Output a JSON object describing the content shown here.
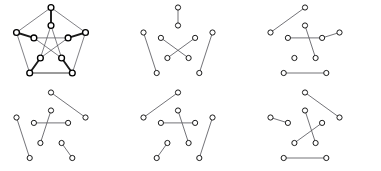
{
  "figure": {
    "width": 381,
    "height": 171,
    "background_color": "#ffffff",
    "node_fill_color": "#ffffff",
    "node_stroke_color": "#111111",
    "edge_color_thin": "#4a4a52",
    "edge_color_bold": "#1a1a1a",
    "edge_color_gray": "#8e8e8e",
    "node_radius": 2.6,
    "node_radius_bold": 2.9
  },
  "graph_layout": {
    "name": "petersen-standard-layout",
    "vertex_count": 10,
    "outer_labels": [
      "o0",
      "o1",
      "o2",
      "o3",
      "o4"
    ],
    "inner_labels": [
      "i0",
      "i1",
      "i2",
      "i3",
      "i4"
    ],
    "outer": [
      {
        "id": "o0",
        "x": 51.0,
        "y": 7.5
      },
      {
        "id": "o1",
        "x": 85.5,
        "y": 32.5
      },
      {
        "id": "o2",
        "x": 72.3,
        "y": 73.0
      },
      {
        "id": "o3",
        "x": 29.7,
        "y": 73.0
      },
      {
        "id": "o4",
        "x": 16.5,
        "y": 32.5
      }
    ],
    "inner": [
      {
        "id": "i0",
        "x": 51.0,
        "y": 25.5
      },
      {
        "id": "i1",
        "x": 68.1,
        "y": 37.9
      },
      {
        "id": "i2",
        "x": 61.6,
        "y": 58.0
      },
      {
        "id": "i3",
        "x": 40.4,
        "y": 58.0
      },
      {
        "id": "i4",
        "x": 33.9,
        "y": 37.9
      }
    ]
  },
  "panels": [
    {
      "index": 1,
      "name": "petersen-graph-full",
      "caption": "Petersen graph with a perfect matching in bold",
      "origin": {
        "x": 0,
        "y": 0
      },
      "edges_thin": [
        [
          "o0",
          "o1"
        ],
        [
          "o1",
          "o2"
        ],
        [
          "o2",
          "o3"
        ],
        [
          "o3",
          "o4"
        ],
        [
          "o4",
          "o0"
        ],
        [
          "i0",
          "i2"
        ],
        [
          "i2",
          "i4"
        ],
        [
          "i4",
          "i1"
        ],
        [
          "i1",
          "i3"
        ],
        [
          "i3",
          "i0"
        ]
      ],
      "edges_bold": [
        [
          "o0",
          "i0"
        ],
        [
          "o1",
          "i1"
        ],
        [
          "o2",
          "i2"
        ],
        [
          "o3",
          "i3"
        ],
        [
          "o4",
          "i4"
        ]
      ],
      "edges_gray": [
        [
          "o3",
          "o2"
        ]
      ]
    },
    {
      "index": 2,
      "name": "perfect-matching-a",
      "caption": "Perfect matching A",
      "origin": {
        "x": 127,
        "y": 0
      },
      "edges_thin": [],
      "edges_bold": [],
      "edges_gray": [],
      "edges_match": [
        [
          "o0",
          "i0"
        ],
        [
          "o4",
          "o3"
        ],
        [
          "o1",
          "o2"
        ],
        [
          "i4",
          "i2"
        ],
        [
          "i1",
          "i3"
        ]
      ]
    },
    {
      "index": 3,
      "name": "perfect-matching-b",
      "caption": "Perfect matching B",
      "origin": {
        "x": 254,
        "y": 0
      },
      "edges_match": [
        [
          "o0",
          "o4"
        ],
        [
          "i0",
          "i2"
        ],
        [
          "i4",
          "i1"
        ],
        [
          "o1",
          "i1"
        ],
        [
          "o3",
          "o2"
        ]
      ]
    },
    {
      "index": 4,
      "name": "perfect-matching-c",
      "caption": "Perfect matching C",
      "origin": {
        "x": 0,
        "y": 85
      },
      "edges_match": [
        [
          "o0",
          "o1"
        ],
        [
          "o4",
          "o3"
        ],
        [
          "i4",
          "i1"
        ],
        [
          "i0",
          "i3"
        ],
        [
          "i2",
          "o2"
        ]
      ]
    },
    {
      "index": 5,
      "name": "perfect-matching-d",
      "caption": "Perfect matching D",
      "origin": {
        "x": 127,
        "y": 85
      },
      "edges_match": [
        [
          "o0",
          "o4"
        ],
        [
          "i4",
          "i1"
        ],
        [
          "i0",
          "i2"
        ],
        [
          "i3",
          "o3"
        ],
        [
          "o1",
          "o2"
        ]
      ]
    },
    {
      "index": 6,
      "name": "perfect-matching-e",
      "caption": "Perfect matching E",
      "origin": {
        "x": 254,
        "y": 85
      },
      "edges_match": [
        [
          "o0",
          "o1"
        ],
        [
          "o4",
          "i4"
        ],
        [
          "i0",
          "i2"
        ],
        [
          "i1",
          "i3"
        ],
        [
          "o3",
          "o2"
        ]
      ]
    }
  ]
}
